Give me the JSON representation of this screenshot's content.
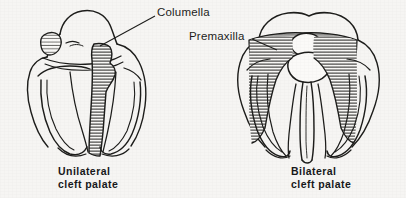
{
  "figure": {
    "background_color": "#f6f5f3",
    "ink_color": "#1d1d1b",
    "style": "pen-and-ink line drawing with line hatching"
  },
  "annotations": [
    {
      "id": "columella",
      "label": "Columella",
      "points_to": "unilateral cleft palate, central nasal septum base",
      "leader_from": [
        155,
        16
      ],
      "leader_to": [
        100,
        46
      ]
    },
    {
      "id": "premaxilla",
      "label": "Premaxilla",
      "points_to": "bilateral cleft palate, protruding premaxillary segment",
      "leader_from": [
        252,
        38
      ],
      "leader_to": [
        277,
        50
      ]
    }
  ],
  "panels": [
    {
      "id": "unilateral",
      "caption_line1": "Unilateral",
      "caption_line2": "cleft palate",
      "description": "Superior view of palate with a single cleft on one side; hatched cleft band runs vertically right of midline.",
      "cleft_count": 1
    },
    {
      "id": "bilateral",
      "caption_line1": "Bilateral",
      "caption_line2": "cleft palate",
      "description": "Superior view of palate with clefts on both sides of a central premaxilla; two hatched cleft bands flank the vomer.",
      "cleft_count": 2
    }
  ]
}
